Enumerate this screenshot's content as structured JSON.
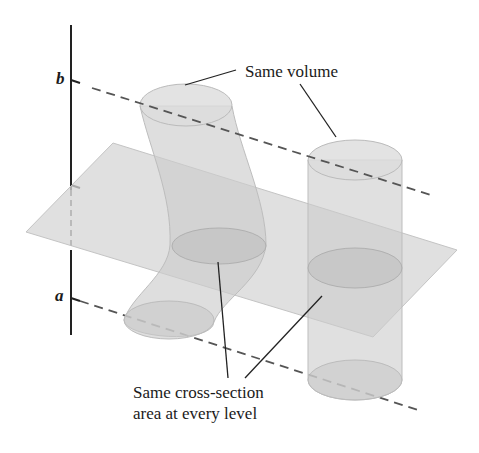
{
  "figure": {
    "type": "cavalieri-principle-diagram",
    "axis": {
      "upper_label": "b",
      "lower_label": "a"
    },
    "annotations": {
      "top": "Same volume",
      "bottom_line1": "Same cross-section",
      "bottom_line2": "area at every level"
    },
    "shapes": [
      {
        "name": "slanted-cylinder",
        "description": "oblique curved solid"
      },
      {
        "name": "right-cylinder",
        "description": "upright circular cylinder"
      },
      {
        "name": "cross-section-plane",
        "description": "horizontal plane cutting both solids"
      }
    ],
    "colors": {
      "solid_fill": "#cfcfcf",
      "plane_fill": "#d8d8d8",
      "line": "#333333",
      "dash": "#555555"
    }
  }
}
